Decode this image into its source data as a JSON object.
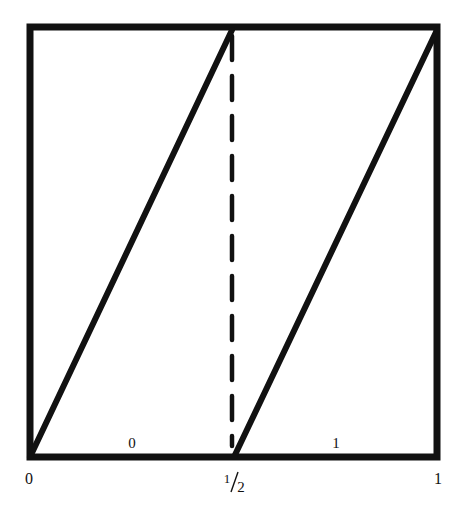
{
  "diagram": {
    "type": "piecewise-linear-map",
    "colors": {
      "ink": "#111111",
      "background": "#ffffff"
    },
    "x_axis_labels": {
      "left": "0",
      "middle": "1/2",
      "middle_numerator": "1",
      "middle_denominator": "2",
      "right": "1"
    },
    "region_labels": {
      "left_region": "0",
      "right_region": "1"
    },
    "segments": [
      {
        "name": "left-branch",
        "from": [
          0,
          0
        ],
        "to": [
          0.5,
          1
        ]
      },
      {
        "name": "right-branch",
        "from": [
          0.5,
          0
        ],
        "to": [
          1,
          1
        ]
      }
    ],
    "divider": {
      "x": 0.5,
      "style": "dashed"
    }
  }
}
